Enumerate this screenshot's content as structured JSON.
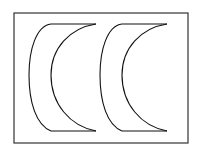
{
  "diagram": {
    "stroke_color": "#222222",
    "background": "#ffffff",
    "shapes": [
      {
        "name": "crescent-left",
        "offset_x": 0
      },
      {
        "name": "crescent-right",
        "offset_x": 71
      }
    ]
  }
}
